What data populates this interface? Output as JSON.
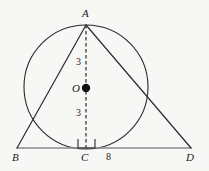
{
  "diagram": {
    "background_color": "#f7f7f5",
    "stroke_color": "#2b2b2b",
    "baseline_color": "#8a8a8a",
    "labels": {
      "apex": "A",
      "left_base": "B",
      "foot": "C",
      "right_base": "D",
      "center": "O"
    },
    "measures": {
      "upper_segment": "3",
      "lower_segment": "3",
      "base_segment": "8"
    },
    "geometry": {
      "A": {
        "x": 86,
        "y": 25
      },
      "B": {
        "x": 17,
        "y": 148
      },
      "C": {
        "x": 86,
        "y": 148
      },
      "D": {
        "x": 191,
        "y": 148
      },
      "O": {
        "x": 86,
        "y": 88
      },
      "circle": {
        "cx": 86,
        "cy": 87,
        "r": 62
      },
      "right_angle_marker": {
        "x": 78,
        "y": 139,
        "size": 9
      },
      "center_dot_radius": 4
    }
  }
}
